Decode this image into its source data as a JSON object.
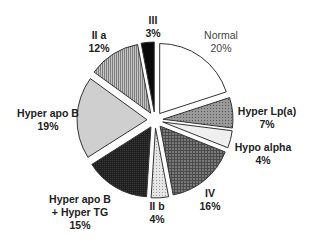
{
  "chart_data": {
    "type": "pie",
    "title": "",
    "exploded": true,
    "start_angle_deg": 0,
    "direction": "clockwise",
    "slices": [
      {
        "label": "Normal",
        "value": 20,
        "pct_label": "20%",
        "fill": "#ffffff",
        "pattern": "none"
      },
      {
        "label": "Hyper Lp(a)",
        "value": 7,
        "pct_label": "7%",
        "fill": "#8a8a8a",
        "pattern": "dots"
      },
      {
        "label": "Hypo alpha",
        "value": 4,
        "pct_label": "4%",
        "fill": "#efefef",
        "pattern": "none"
      },
      {
        "label": "IV",
        "value": 16,
        "pct_label": "16%",
        "fill": "#6a6a6a",
        "pattern": "crosshatch"
      },
      {
        "label": "II b",
        "value": 4,
        "pct_label": "4%",
        "fill": "#dcdcdc",
        "pattern": "dots"
      },
      {
        "label": "Hyper apo B + Hyper TG",
        "value": 15,
        "pct_label": "15%",
        "fill": "#1c1c1c",
        "pattern": "dense"
      },
      {
        "label": "Hyper apo B",
        "value": 19,
        "pct_label": "19%",
        "fill": "#cfcfcf",
        "pattern": "none"
      },
      {
        "label": "II a",
        "value": 12,
        "pct_label": "12%",
        "fill": "#a8a8a8",
        "pattern": "vertical-lines"
      },
      {
        "label": "III",
        "value": 3,
        "pct_label": "3%",
        "fill": "#0a0a0a",
        "pattern": "none"
      }
    ],
    "categories": [
      "Normal",
      "Hyper Lp(a)",
      "Hypo alpha",
      "IV",
      "II b",
      "Hyper apo B + Hyper TG",
      "Hyper apo B",
      "II a",
      "III"
    ],
    "values": [
      20,
      7,
      4,
      16,
      4,
      15,
      19,
      12,
      3
    ],
    "legend": "none (direct labels)"
  },
  "labels": {
    "normal": {
      "name": "Normal",
      "pct": "20%"
    },
    "lpa": {
      "name": "Hyper Lp(a)",
      "pct": "7%"
    },
    "hypo": {
      "name": "Hypo alpha",
      "pct": "4%"
    },
    "iv": {
      "name": "IV",
      "pct": "16%"
    },
    "iib": {
      "name": "II b",
      "pct": "4%"
    },
    "apobtg": {
      "name1": "Hyper apo B",
      "name2": "+ Hyper TG",
      "pct": "15%"
    },
    "apob": {
      "name": "Hyper apo B",
      "pct": "19%"
    },
    "iia": {
      "name": "II a",
      "pct": "12%"
    },
    "iii": {
      "name": "III",
      "pct": "3%"
    }
  }
}
